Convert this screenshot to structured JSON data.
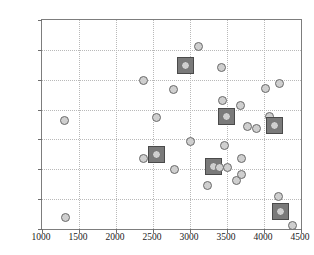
{
  "chart_data": {
    "type": "scatter",
    "title": "",
    "xlabel": "",
    "ylabel": "",
    "xlim": [
      1000,
      4500
    ],
    "ylim": [
      500,
      4000
    ],
    "grid": true,
    "legend": null,
    "xticks": [
      1000,
      1500,
      2000,
      2500,
      3000,
      3500,
      4000,
      4500
    ],
    "yticks": [
      500,
      1000,
      1500,
      2000,
      2500,
      3000,
      3500,
      4000
    ],
    "xtick_labels": [
      "1000",
      "1500",
      "2000",
      "2500",
      "3000",
      "3500",
      "4000",
      "4500"
    ],
    "ytick_labels": [
      "500",
      "1000",
      "1500",
      "2000",
      "2500",
      "3000",
      "3500",
      "4000"
    ],
    "series": [
      {
        "name": "points",
        "marker": "circle",
        "marker_face_color": "#cfcfcf",
        "marker_edge_color": "#6a6a6a",
        "points": [
          {
            "x": 1300,
            "y": 2310,
            "highlighted": false
          },
          {
            "x": 1320,
            "y": 700,
            "highlighted": false
          },
          {
            "x": 2375,
            "y": 2985,
            "highlighted": false
          },
          {
            "x": 2370,
            "y": 1675,
            "highlighted": false
          },
          {
            "x": 2545,
            "y": 2360,
            "highlighted": false
          },
          {
            "x": 2550,
            "y": 1740,
            "highlighted": true
          },
          {
            "x": 2780,
            "y": 2830,
            "highlighted": false
          },
          {
            "x": 2785,
            "y": 1500,
            "highlighted": false
          },
          {
            "x": 2935,
            "y": 3235,
            "highlighted": true
          },
          {
            "x": 3000,
            "y": 1970,
            "highlighted": false
          },
          {
            "x": 3120,
            "y": 3555,
            "highlighted": false
          },
          {
            "x": 3235,
            "y": 1235,
            "highlighted": false
          },
          {
            "x": 3320,
            "y": 1550,
            "highlighted": true
          },
          {
            "x": 3395,
            "y": 1535,
            "highlighted": false
          },
          {
            "x": 3430,
            "y": 3205,
            "highlighted": false
          },
          {
            "x": 3435,
            "y": 2645,
            "highlighted": false
          },
          {
            "x": 3460,
            "y": 1900,
            "highlighted": false
          },
          {
            "x": 3490,
            "y": 2385,
            "highlighted": true
          },
          {
            "x": 3500,
            "y": 1530,
            "highlighted": false
          },
          {
            "x": 3625,
            "y": 1320,
            "highlighted": false
          },
          {
            "x": 3680,
            "y": 2570,
            "highlighted": false
          },
          {
            "x": 3690,
            "y": 1675,
            "highlighted": false
          },
          {
            "x": 3700,
            "y": 1405,
            "highlighted": false
          },
          {
            "x": 3780,
            "y": 2215,
            "highlighted": false
          },
          {
            "x": 3900,
            "y": 2180,
            "highlighted": false
          },
          {
            "x": 4020,
            "y": 2850,
            "highlighted": false
          },
          {
            "x": 4075,
            "y": 2385,
            "highlighted": false
          },
          {
            "x": 4140,
            "y": 2240,
            "highlighted": true
          },
          {
            "x": 4215,
            "y": 2935,
            "highlighted": false
          },
          {
            "x": 4195,
            "y": 1050,
            "highlighted": false
          },
          {
            "x": 4225,
            "y": 795,
            "highlighted": true
          },
          {
            "x": 4385,
            "y": 560,
            "highlighted": false
          }
        ]
      }
    ]
  },
  "colors": {
    "marker_face": "#cfcfcf",
    "marker_edge": "#6a6a6a",
    "highlight_square": "#7a7a7a",
    "gridline": "#b9b9b9",
    "axis": "#7d7d7d",
    "background": "#ffffff"
  }
}
